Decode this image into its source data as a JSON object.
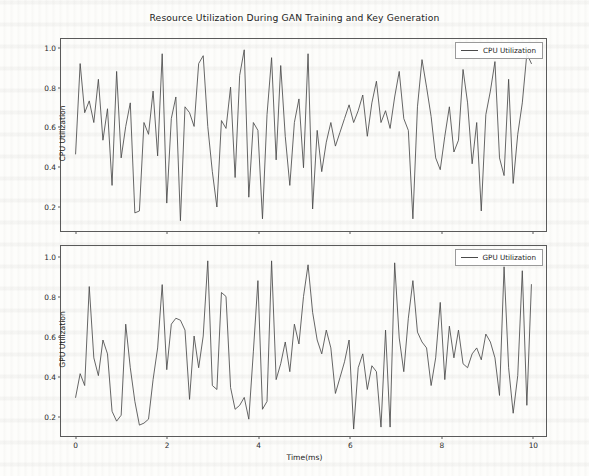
{
  "figure": {
    "title": "Resource Utilization During GAN Training and Key Generation",
    "width": 589,
    "height": 476,
    "background_color": "#fdfdfb",
    "line_color": "#4a4a4a",
    "axis_color": "#5a5a5a"
  },
  "chart_data": [
    {
      "type": "line",
      "title": "Resource Utilization During GAN Training and Key Generation",
      "subplot": "top",
      "xlabel": "",
      "ylabel": "CPU Utilization",
      "xlim": [
        -0.32,
        10.32
      ],
      "ylim": [
        0.068,
        1.045
      ],
      "xticks": [
        0,
        2,
        4,
        6,
        8,
        10
      ],
      "xtick_labels": [
        "0",
        "2",
        "4",
        "6",
        "8",
        "10"
      ],
      "yticks": [
        0.2,
        0.4,
        0.6,
        0.8,
        1.0
      ],
      "ytick_labels": [
        "0.2",
        "0.4",
        "0.6",
        "0.8",
        "1.0"
      ],
      "grid": false,
      "legend_position": "upper right",
      "series": [
        {
          "name": "CPU Utilization",
          "color": "#4a4a4a",
          "x": [
            0.0,
            0.1,
            0.2,
            0.3,
            0.4,
            0.5,
            0.6,
            0.7,
            0.8,
            0.9,
            1.0,
            1.1,
            1.2,
            1.3,
            1.4,
            1.5,
            1.6,
            1.7,
            1.8,
            1.9,
            2.0,
            2.1,
            2.2,
            2.3,
            2.4,
            2.5,
            2.6,
            2.7,
            2.8,
            2.9,
            3.0,
            3.1,
            3.2,
            3.3,
            3.4,
            3.5,
            3.6,
            3.7,
            3.8,
            3.9,
            4.0,
            4.1,
            4.2,
            4.3,
            4.4,
            4.5,
            4.6,
            4.7,
            4.8,
            4.9,
            5.0,
            5.1,
            5.2,
            5.3,
            5.4,
            5.5,
            5.6,
            5.7,
            5.8,
            5.9,
            6.0,
            6.1,
            6.2,
            6.3,
            6.4,
            6.5,
            6.6,
            6.7,
            6.8,
            6.9,
            7.0,
            7.1,
            7.2,
            7.3,
            7.4,
            7.5,
            7.6,
            7.7,
            7.8,
            7.9,
            8.0,
            8.1,
            8.2,
            8.3,
            8.4,
            8.5,
            8.6,
            8.7,
            8.8,
            8.9,
            9.0,
            9.1,
            9.2,
            9.3,
            9.4,
            9.5,
            9.6,
            9.7,
            9.8,
            9.9,
            10.0
          ],
          "values": [
            0.46,
            0.92,
            0.67,
            0.73,
            0.62,
            0.84,
            0.53,
            0.69,
            0.3,
            0.88,
            0.44,
            0.6,
            0.72,
            0.16,
            0.17,
            0.62,
            0.56,
            0.78,
            0.45,
            0.97,
            0.21,
            0.64,
            0.75,
            0.12,
            0.7,
            0.67,
            0.6,
            0.92,
            0.96,
            0.6,
            0.37,
            0.19,
            0.63,
            0.59,
            0.8,
            0.34,
            0.86,
            0.99,
            0.24,
            0.62,
            0.58,
            0.13,
            0.66,
            0.95,
            0.43,
            0.91,
            0.55,
            0.3,
            0.62,
            0.74,
            0.39,
            0.97,
            0.18,
            0.58,
            0.37,
            0.52,
            0.62,
            0.5,
            0.57,
            0.64,
            0.71,
            0.62,
            0.68,
            0.76,
            0.55,
            0.72,
            0.83,
            0.62,
            0.68,
            0.59,
            0.75,
            0.88,
            0.64,
            0.58,
            0.13,
            0.7,
            0.94,
            0.8,
            0.65,
            0.44,
            0.38,
            0.55,
            0.7,
            0.47,
            0.53,
            0.89,
            0.72,
            0.41,
            0.62,
            0.17,
            0.66,
            0.78,
            0.93,
            0.44,
            0.35,
            0.84,
            0.31,
            0.56,
            0.72,
            0.97,
            0.92
          ]
        }
      ]
    },
    {
      "type": "line",
      "subplot": "bottom",
      "xlabel": "Time(ms)",
      "ylabel": "GPU Utilization",
      "xlim": [
        -0.32,
        10.32
      ],
      "ylim": [
        0.095,
        1.055
      ],
      "xticks": [
        0,
        2,
        4,
        6,
        8,
        10
      ],
      "xtick_labels": [
        "0",
        "2",
        "4",
        "6",
        "8",
        "10"
      ],
      "yticks": [
        0.2,
        0.4,
        0.6,
        0.8,
        1.0
      ],
      "ytick_labels": [
        "0.2",
        "0.4",
        "0.6",
        "0.8",
        "1.0"
      ],
      "grid": false,
      "legend_position": "upper right",
      "series": [
        {
          "name": "GPU Utilization",
          "color": "#4a4a4a",
          "x": [
            0.0,
            0.1,
            0.2,
            0.3,
            0.4,
            0.5,
            0.6,
            0.7,
            0.8,
            0.9,
            1.0,
            1.1,
            1.2,
            1.3,
            1.4,
            1.5,
            1.6,
            1.7,
            1.8,
            1.9,
            2.0,
            2.1,
            2.2,
            2.3,
            2.4,
            2.5,
            2.6,
            2.7,
            2.8,
            2.9,
            3.0,
            3.1,
            3.2,
            3.3,
            3.4,
            3.5,
            3.6,
            3.7,
            3.8,
            3.9,
            4.0,
            4.1,
            4.2,
            4.3,
            4.4,
            4.5,
            4.6,
            4.7,
            4.8,
            4.9,
            5.0,
            5.1,
            5.2,
            5.3,
            5.4,
            5.5,
            5.6,
            5.7,
            5.8,
            5.9,
            6.0,
            6.1,
            6.2,
            6.3,
            6.4,
            6.5,
            6.6,
            6.7,
            6.8,
            6.9,
            7.0,
            7.1,
            7.2,
            7.3,
            7.4,
            7.5,
            7.6,
            7.7,
            7.8,
            7.9,
            8.0,
            8.1,
            8.2,
            8.3,
            8.4,
            8.5,
            8.6,
            8.7,
            8.8,
            8.9,
            9.0,
            9.1,
            9.2,
            9.3,
            9.4,
            9.5,
            9.6,
            9.7,
            9.8,
            9.9,
            10.0
          ],
          "values": [
            0.29,
            0.41,
            0.35,
            0.85,
            0.49,
            0.4,
            0.58,
            0.51,
            0.22,
            0.17,
            0.2,
            0.66,
            0.44,
            0.27,
            0.15,
            0.16,
            0.18,
            0.38,
            0.54,
            0.86,
            0.43,
            0.66,
            0.69,
            0.68,
            0.63,
            0.28,
            0.6,
            0.44,
            0.6,
            0.98,
            0.35,
            0.33,
            0.82,
            0.8,
            0.34,
            0.23,
            0.25,
            0.29,
            0.18,
            0.52,
            0.88,
            0.23,
            0.27,
            0.98,
            0.38,
            0.46,
            0.57,
            0.42,
            0.66,
            0.56,
            0.8,
            0.96,
            0.72,
            0.58,
            0.51,
            0.63,
            0.54,
            0.31,
            0.39,
            0.47,
            0.58,
            0.13,
            0.44,
            0.51,
            0.33,
            0.45,
            0.42,
            0.14,
            0.63,
            0.14,
            0.97,
            0.59,
            0.42,
            0.69,
            0.88,
            0.62,
            0.57,
            0.54,
            0.35,
            0.49,
            0.77,
            0.38,
            0.65,
            0.49,
            0.63,
            0.46,
            0.44,
            0.51,
            0.54,
            0.48,
            0.61,
            0.57,
            0.49,
            0.3,
            0.95,
            0.44,
            0.21,
            0.4,
            0.93,
            0.25,
            0.86
          ]
        }
      ]
    }
  ],
  "cpu_panel": {
    "ylabel": "CPU Utilization",
    "legend_label": "CPU Utilization",
    "ytick_labels": [
      "1.0",
      "0.8",
      "0.6",
      "0.4",
      "0.2"
    ],
    "xtick_labels": [
      "0",
      "2",
      "4",
      "6",
      "8",
      "10"
    ]
  },
  "gpu_panel": {
    "ylabel": "GPU Utilization",
    "legend_label": "GPU Utilization",
    "ytick_labels": [
      "1.0",
      "0.8",
      "0.6",
      "0.4",
      "0.2"
    ],
    "xtick_labels": [
      "0",
      "2",
      "4",
      "6",
      "8",
      "10"
    ],
    "xlabel": "Time(ms)"
  }
}
